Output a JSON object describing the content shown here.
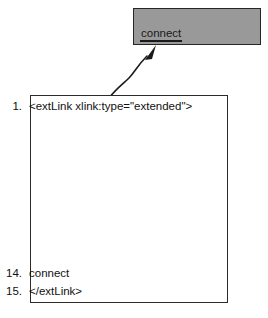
{
  "figure": {
    "name": "xml-code-listing-with-callout",
    "callout": {
      "label": "connect",
      "fill_color": "#999999",
      "border_color": "#262626",
      "label_underlined": true
    },
    "arrow": {
      "name": "curved-arrow",
      "direction": "up-right",
      "color": "#1a1a1a"
    },
    "code_box": {
      "border_color": "#2b2b2b",
      "background_color": "#ffffff",
      "lines": [
        {
          "number": "1.",
          "text": "<extLink xlink:type=\"extended\">"
        },
        {
          "number": "14.",
          "text": "connect"
        },
        {
          "number": "15.",
          "text": "</extLink>"
        }
      ]
    }
  }
}
